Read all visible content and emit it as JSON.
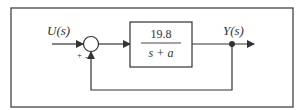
{
  "diagram": {
    "type": "feedback-block-diagram",
    "input_label": "U(s)",
    "output_label": "Y(s)",
    "block": {
      "numerator": "19.8",
      "denominator": "s + a"
    },
    "summing_junction": {
      "plus_sign": "+",
      "minus_sign": "-"
    },
    "colors": {
      "line": "#333333",
      "background": "#ffffff"
    }
  }
}
